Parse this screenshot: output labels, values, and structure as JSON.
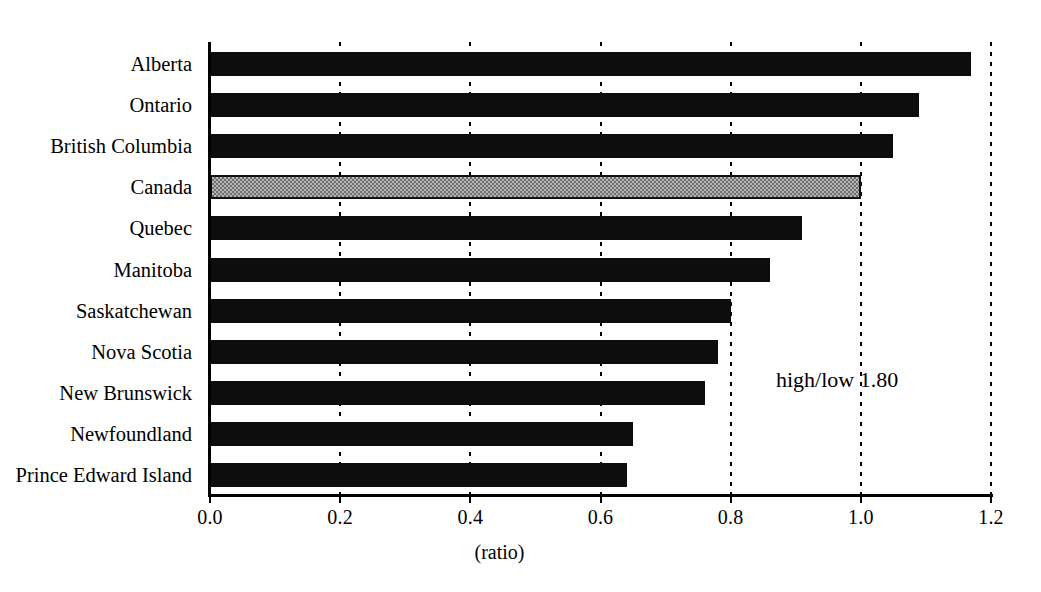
{
  "chart_data": {
    "type": "bar",
    "orientation": "horizontal",
    "title": "",
    "subtitle": "",
    "xlabel": "(ratio)",
    "ylabel": "",
    "xlim": [
      0.0,
      1.2
    ],
    "xticks": [
      "0.0",
      "0.2",
      "0.4",
      "0.6",
      "0.8",
      "1.0",
      "1.2"
    ],
    "xtick_values": [
      0.0,
      0.2,
      0.4,
      0.6,
      0.8,
      1.0,
      1.2
    ],
    "grid": "vertical-dashed",
    "legend": "none",
    "categories": [
      "Alberta",
      "Ontario",
      "British Columbia",
      "Canada",
      "Quebec",
      "Manitoba",
      "Saskatchewan",
      "Nova Scotia",
      "New Brunswick",
      "Newfoundland",
      "Prince Edward Island"
    ],
    "values": [
      1.17,
      1.09,
      1.05,
      1.0,
      0.91,
      0.86,
      0.8,
      0.78,
      0.76,
      0.65,
      0.64
    ],
    "highlight_category": "Canada",
    "highlight_index": 3,
    "annotations": [
      {
        "text": "high/low 1.80",
        "x": 0.87,
        "y_category": "New Brunswick"
      }
    ],
    "colors": {
      "bar": "#0d0d0d",
      "highlight_bar": "#b5b5b5",
      "highlight_outline": "#111111",
      "axis": "#000000",
      "grid": "#000000",
      "background": "#ffffff",
      "text": "#000000"
    }
  }
}
